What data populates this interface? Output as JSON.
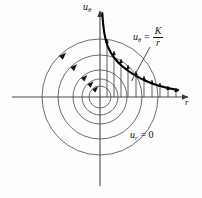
{
  "figure": {
    "name": "free-vortex-velocity-distribution",
    "background_color": "#fdfdfd",
    "line_color": "#3a3a3a",
    "curve_color": "#000000",
    "axes": {
      "vertical": {
        "label_u": "u",
        "label_sub": "θ",
        "name": "u-theta-axis",
        "x": 100,
        "top": 10,
        "bottom": 186
      },
      "horizontal": {
        "label": "r",
        "name": "r-axis",
        "y": 97,
        "left": 12,
        "right": 190
      },
      "origin": {
        "x": 100,
        "y": 97
      }
    },
    "streamlines": {
      "name": "concentric-streamline-circles",
      "description": "circular streamlines of the free vortex",
      "radii": [
        11,
        18,
        27,
        42,
        58
      ],
      "arrow_direction": "counter-clockwise",
      "arrow_count": 5
    },
    "profile_curve": {
      "name": "u-theta-hyperbola",
      "equation_text": "u_theta = K / r",
      "equation_parts": {
        "lhs_u": "u",
        "lhs_sub": "θ",
        "equals": "=",
        "numerator": "K",
        "denominator": "r"
      },
      "shape": "hyperbola",
      "asymptotes": [
        "u-theta-axis",
        "r-axis"
      ],
      "points": [
        {
          "r": 3,
          "u": 86
        },
        {
          "r": 6,
          "u": 62
        },
        {
          "r": 10,
          "u": 48
        },
        {
          "r": 15,
          "u": 38
        },
        {
          "r": 21,
          "u": 31
        },
        {
          "r": 28,
          "u": 25
        },
        {
          "r": 36,
          "u": 20
        },
        {
          "r": 45,
          "u": 16
        },
        {
          "r": 55,
          "u": 13
        },
        {
          "r": 66,
          "u": 10
        },
        {
          "r": 78,
          "u": 8
        },
        {
          "r": 90,
          "u": 6
        }
      ]
    },
    "velocity_vectors": {
      "name": "velocity-vector-arrows",
      "description": "vertical arrows from the r-axis up to the hyperbola",
      "count": 10,
      "r_values": [
        7,
        14,
        21,
        28,
        36,
        44,
        52,
        60,
        68,
        76
      ]
    },
    "annotations": [
      {
        "name": "radial-velocity-annotation",
        "text_u": "u",
        "text_sub": "r",
        "text_rest": "= 0",
        "x": 130,
        "y": 130
      }
    ],
    "leader_line": {
      "name": "equation-leader-line",
      "from": [
        150,
        48
      ],
      "to": [
        131,
        82
      ]
    }
  }
}
